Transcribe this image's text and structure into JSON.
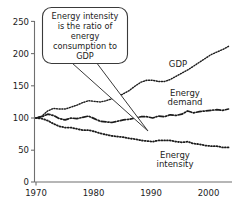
{
  "chart_data": {
    "type": "line",
    "title": "",
    "subtitle": "",
    "xlabel": "",
    "ylabel": "",
    "xlim": [
      1970,
      2004
    ],
    "ylim": [
      0,
      250
    ],
    "grid": false,
    "legend_position": "inline-labels",
    "x_ticks": [
      "1970",
      "1980",
      "1990",
      "2000"
    ],
    "x_tick_values": [
      1970,
      1980,
      1990,
      2000
    ],
    "y_ticks": [
      "0",
      "50",
      "100",
      "150",
      "200",
      "250"
    ],
    "y_tick_values": [
      0,
      50,
      100,
      150,
      200,
      250
    ],
    "x": [
      1970,
      1971,
      1972,
      1973,
      1974,
      1975,
      1976,
      1977,
      1978,
      1979,
      1980,
      1981,
      1982,
      1983,
      1984,
      1985,
      1986,
      1987,
      1988,
      1989,
      1990,
      1991,
      1992,
      1993,
      1994,
      1995,
      1996,
      1997,
      1998,
      1999,
      2000,
      2001,
      2002,
      2003
    ],
    "series": [
      {
        "name": "GDP",
        "style": "dotted",
        "label": "GDP",
        "values": [
          100,
          103,
          111,
          115,
          114,
          114,
          117,
          120,
          124,
          127,
          126,
          125,
          127,
          130,
          133,
          138,
          143,
          150,
          156,
          159,
          159,
          157,
          157,
          160,
          165,
          170,
          175,
          181,
          187,
          193,
          199,
          203,
          207,
          212
        ]
      },
      {
        "name": "Energy demand",
        "style": "dash-dot",
        "label": "Energy demand",
        "values": [
          100,
          102,
          106,
          104,
          99,
          97,
          100,
          99,
          101,
          103,
          99,
          95,
          94,
          93,
          95,
          97,
          98,
          100,
          102,
          102,
          100,
          103,
          102,
          105,
          104,
          106,
          111,
          108,
          110,
          111,
          112,
          113,
          112,
          114
        ]
      },
      {
        "name": "Energy intensity",
        "style": "fine-dotted",
        "label": "Energy intensity",
        "values": [
          100,
          99,
          96,
          91,
          87,
          85,
          85,
          83,
          81,
          81,
          79,
          76,
          74,
          72,
          71,
          70,
          68,
          67,
          65,
          64,
          63,
          65,
          65,
          65,
          63,
          62,
          63,
          60,
          59,
          57,
          56,
          56,
          54,
          54
        ]
      }
    ],
    "annotations": [
      {
        "name": "energy-intensity-callout",
        "lines": [
          "Energy intensity",
          "is the ratio of",
          "energy",
          "consumption to",
          "GDP"
        ],
        "points_to_x": 1990,
        "points_to_series": "Energy intensity"
      }
    ],
    "colors": {
      "line": "#1b1b1b",
      "axis": "#6f6f6f",
      "callout_border": "#3a3a3a",
      "background": "#ffffff"
    }
  }
}
